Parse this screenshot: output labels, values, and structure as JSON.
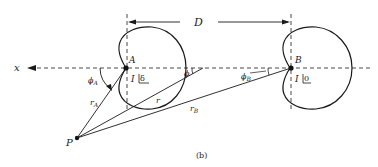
{
  "diagram": {
    "caption": "(b)",
    "axis_label": "x",
    "separation_label": "D",
    "elements": {
      "A": {
        "name": "A",
        "current_label": "I",
        "phase_label": "δ"
      },
      "B": {
        "name": "B",
        "current_label": "I",
        "phase_label": "0"
      }
    },
    "observer": {
      "name": "P"
    },
    "distances": {
      "r": "r",
      "r_A_base": "r",
      "r_A_sub": "A",
      "r_B_base": "r",
      "r_B_sub": "B"
    },
    "angles": {
      "phi": "ϕ",
      "phi_A_base": "ϕ",
      "phi_A_sub": "A",
      "phi_B_base": "ϕ",
      "phi_B_sub": "B"
    }
  }
}
